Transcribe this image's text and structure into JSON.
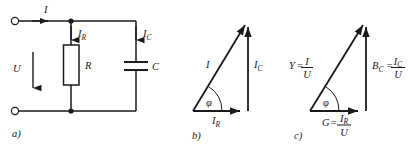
{
  "figure": {
    "caption_a": "a)",
    "caption_b": "b)",
    "caption_c": "c)",
    "stroke_color": "#1a1a1a",
    "background": "#ffffff"
  },
  "circuit": {
    "label_total_current": "I",
    "label_voltage": "U",
    "label_resistor_current": "I",
    "label_resistor_current_sub": "R",
    "label_capacitor_current": "I",
    "label_capacitor_current_sub": "C",
    "label_resistor": "R",
    "label_capacitor": "C"
  },
  "current_triangle": {
    "hypotenuse_label": "I",
    "vertical_label": "I",
    "vertical_label_sub": "C",
    "base_label": "I",
    "base_label_sub": "R",
    "angle_label": "φ"
  },
  "admittance_triangle": {
    "hypotenuse_label": "Y",
    "hypotenuse_eq": "=",
    "hypotenuse_num": "I",
    "hypotenuse_den": "U",
    "vertical_label": "B",
    "vertical_label_sub": "C",
    "vertical_eq": "=",
    "vertical_num": "I",
    "vertical_num_sub": "C",
    "vertical_den": "U",
    "base_label": "G",
    "base_eq": "=",
    "base_num": "I",
    "base_num_sub": "R",
    "base_den": "U",
    "angle_label": "φ"
  }
}
